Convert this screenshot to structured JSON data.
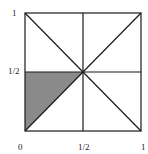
{
  "diagram": {
    "labels": {
      "y_top": "1",
      "y_mid": "1/2",
      "x_origin": "0",
      "x_mid": "1/2",
      "x_right": "1"
    },
    "colors": {
      "line": "#1a1a1a",
      "shade": "#8a8a8a",
      "background": "#ffffff"
    },
    "shaded_region": "triangle (0,0)-(0,1/2)-(1/2,1/2)"
  }
}
